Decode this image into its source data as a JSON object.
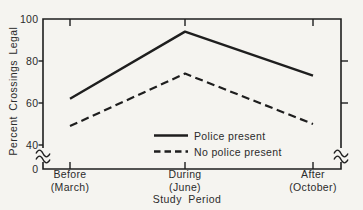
{
  "figure": {
    "background": "#f5f4f0",
    "ink": "#1e1e1e",
    "text_color": "#2b2b2b"
  },
  "chart_data": {
    "type": "line",
    "title": "",
    "xlabel": "Study Period",
    "ylabel": "Percent Crossings Legal",
    "categories": [
      {
        "label": "Before",
        "sublabel": "(March)"
      },
      {
        "label": "During",
        "sublabel": "(June)"
      },
      {
        "label": "After",
        "sublabel": "(October)"
      }
    ],
    "series": [
      {
        "name": "Police present",
        "style": "solid",
        "values": [
          62,
          94,
          73
        ]
      },
      {
        "name": "No police present",
        "style": "dashed",
        "values": [
          49,
          74,
          50
        ]
      }
    ],
    "yticks": [
      100,
      80,
      60,
      40,
      0
    ],
    "ylim": [
      0,
      100
    ],
    "y_axis_break": true,
    "right_axis_ticks": [
      80,
      60
    ],
    "grid": false,
    "legend_position": "inside-bottom-center",
    "line_color": "#1e1e1e"
  }
}
